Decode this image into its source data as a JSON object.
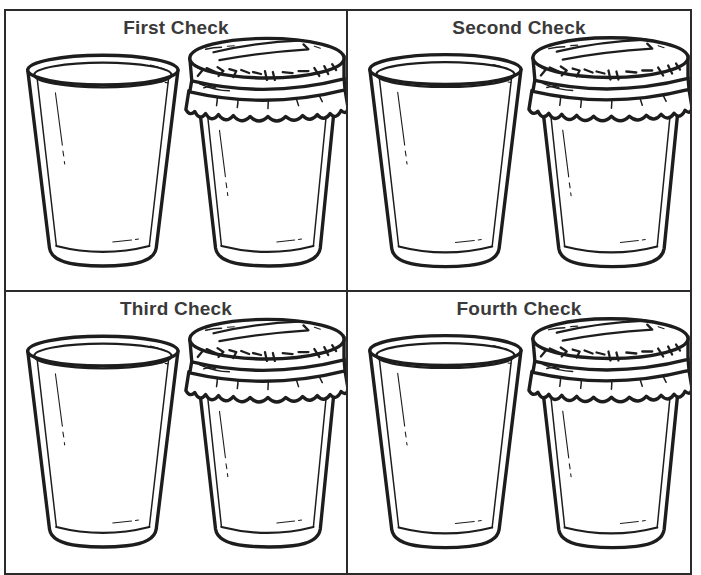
{
  "page": {
    "kind": "worksheet-grid",
    "rows": 2,
    "columns": 2,
    "frame_color": "#2b2b2b",
    "ink_color": "#1d1d1d",
    "background_color": "#ffffff",
    "title_color": "#3a3a3a"
  },
  "panels": [
    {
      "id": "panel-1",
      "title": "First Check",
      "objects": [
        {
          "name": "drinking-glass",
          "state": "empty, uncovered",
          "position": "left"
        },
        {
          "name": "jar-with-cloth-cover",
          "state": "empty, covered with tied cloth lid",
          "position": "right"
        }
      ]
    },
    {
      "id": "panel-2",
      "title": "Second Check",
      "objects": [
        {
          "name": "drinking-glass",
          "state": "empty, uncovered",
          "position": "left"
        },
        {
          "name": "jar-with-cloth-cover",
          "state": "empty, covered with tied cloth lid",
          "position": "right"
        }
      ]
    },
    {
      "id": "panel-3",
      "title": "Third Check",
      "objects": [
        {
          "name": "drinking-glass",
          "state": "empty, uncovered",
          "position": "left"
        },
        {
          "name": "jar-with-cloth-cover",
          "state": "empty, covered with tied cloth lid",
          "position": "right"
        }
      ]
    },
    {
      "id": "panel-4",
      "title": "Fourth Check",
      "objects": [
        {
          "name": "drinking-glass",
          "state": "empty, uncovered",
          "position": "left"
        },
        {
          "name": "jar-with-cloth-cover",
          "state": "empty, covered with tied cloth lid",
          "position": "right"
        }
      ]
    }
  ]
}
